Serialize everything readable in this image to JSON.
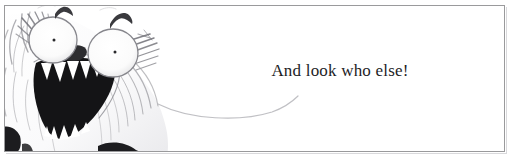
{
  "panel": {
    "name": "picture-book-panel",
    "width": 511,
    "height": 163,
    "background_color": "#ffffff",
    "frame_color": "#9a9a9c"
  },
  "caption": {
    "text": "And look who else!",
    "color": "#1d1d1f"
  },
  "illustration": {
    "title": "shaggy-monster-face",
    "description": "Close-up pencil and ink drawing of a shaggy white furry creature with two large round bulging eyes, tiny dot pupils, dark angular eyebrows, a small dark nose and a wide open mouth full of jagged triangular teeth.",
    "ink_color": "#2b2b2d",
    "fur_color": "#b4b4b8",
    "mouth_color": "#141416",
    "parts": [
      "left-eyebrow",
      "right-eyebrow",
      "left-eye",
      "right-eye",
      "nose",
      "open-mouth",
      "upper-teeth",
      "lower-teeth",
      "fur-tuft-left",
      "fur-tuft-right",
      "body-contour-line"
    ]
  }
}
